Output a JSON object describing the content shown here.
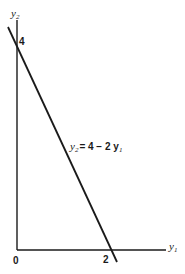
{
  "diagram": {
    "type": "line-graph",
    "axes": {
      "x_label": "y",
      "x_label_sub": "1",
      "y_label": "y",
      "y_label_sub": "2",
      "origin_label": "0"
    },
    "intercepts": {
      "y_intercept_label": "4",
      "x_intercept_label": "2"
    },
    "equation": {
      "lhs": "y",
      "lhs_sub": "2",
      "rhs": "= 4 − 2 y",
      "rhs_sub": "1"
    },
    "colors": {
      "line": "#1a1a1a",
      "background": "#ffffff"
    }
  }
}
